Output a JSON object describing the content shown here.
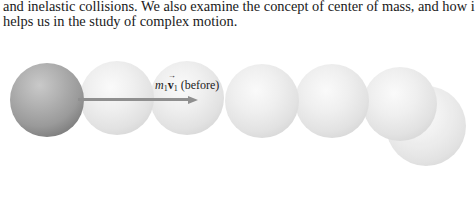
{
  "body_text": {
    "lines": [
      "and inelastic collisions. We also examine the concept of center of mass, and how i",
      "helps us in the study of complex motion."
    ]
  },
  "figure": {
    "label": {
      "mass_symbol": "m",
      "mass_subscript": "1",
      "velocity_symbol": "v",
      "velocity_subscript": "1",
      "vector_mark": "→",
      "qualifier": "(before)"
    },
    "arrow_color": "#8f8f8f",
    "spheres": [
      {
        "type": "dark",
        "cx": 47,
        "cy": 101,
        "r": 37
      },
      {
        "type": "light",
        "cx": 117,
        "cy": 98,
        "r": 37
      },
      {
        "type": "light",
        "cx": 187,
        "cy": 98,
        "r": 37
      },
      {
        "type": "light",
        "cx": 262,
        "cy": 101,
        "r": 37
      },
      {
        "type": "light",
        "cx": 332,
        "cy": 101,
        "r": 37
      },
      {
        "type": "light",
        "cx": 400,
        "cy": 104,
        "r": 37
      },
      {
        "type": "light",
        "cx": 426,
        "cy": 126,
        "r": 40
      }
    ]
  }
}
